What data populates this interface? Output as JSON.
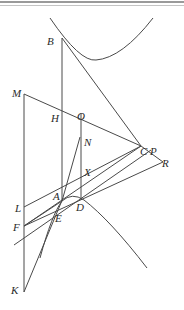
{
  "diagram": {
    "type": "geometric-construction",
    "stroke_color": "#4a4a4a",
    "labels": {
      "B": "B",
      "M": "M",
      "H": "H",
      "O": "O",
      "N": "N",
      "C": "C",
      "P": "P",
      "R": "R",
      "X": "X",
      "A": "A",
      "D": "D",
      "L": "L",
      "E": "E",
      "F": "F",
      "K": "K"
    }
  }
}
